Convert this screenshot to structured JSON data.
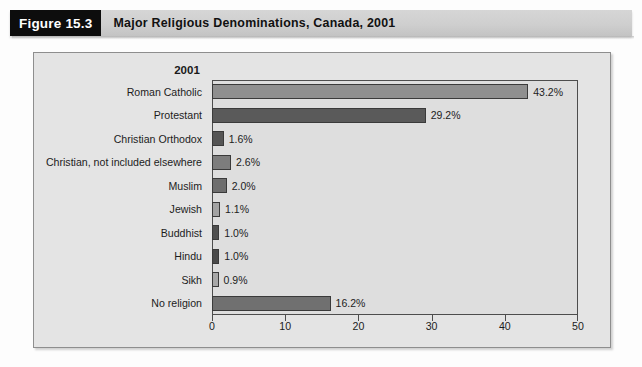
{
  "figure": {
    "number_label": "Figure 15.3",
    "title": "Major Religious Denominations, Canada, 2001"
  },
  "chart_data": {
    "type": "bar",
    "orientation": "horizontal",
    "title": "Major Religious Denominations, Canada, 2001",
    "series_header": "2001",
    "xlabel": "",
    "ylabel": "",
    "xlim": [
      0,
      50
    ],
    "xticks": [
      "0",
      "10",
      "20",
      "30",
      "40",
      "50"
    ],
    "xtick_values": [
      0,
      10,
      20,
      30,
      40,
      50
    ],
    "grid": false,
    "legend": "none",
    "categories": [
      "Roman Catholic",
      "Protestant",
      "Christian Orthodox",
      "Christian, not included elsewhere",
      "Muslim",
      "Jewish",
      "Buddhist",
      "Hindu",
      "Sikh",
      "No religion"
    ],
    "values": [
      43.2,
      29.2,
      1.6,
      2.6,
      2.0,
      1.1,
      1.0,
      1.0,
      0.9,
      16.2
    ],
    "value_labels": [
      "43.2%",
      "29.2%",
      "1.6%",
      "2.6%",
      "2.0%",
      "1.1%",
      "1.0%",
      "1.0%",
      "0.9%",
      "16.2%"
    ],
    "bar_colors": [
      "#8f8f8f",
      "#5a5a5a",
      "#555555",
      "#7d7d7d",
      "#6e6e6e",
      "#a3a3a3",
      "#4f4f4f",
      "#4a4a4a",
      "#a8a8a8",
      "#707070"
    ]
  },
  "colors": {
    "figure_number_bg": "#0d0d0d",
    "figure_number_fg": "#ffffff",
    "header_bg": "#cfcfcf",
    "frame_bg": "#e4e4e4",
    "plot_bg": "#dedede",
    "axis": "#4d4d4d"
  }
}
